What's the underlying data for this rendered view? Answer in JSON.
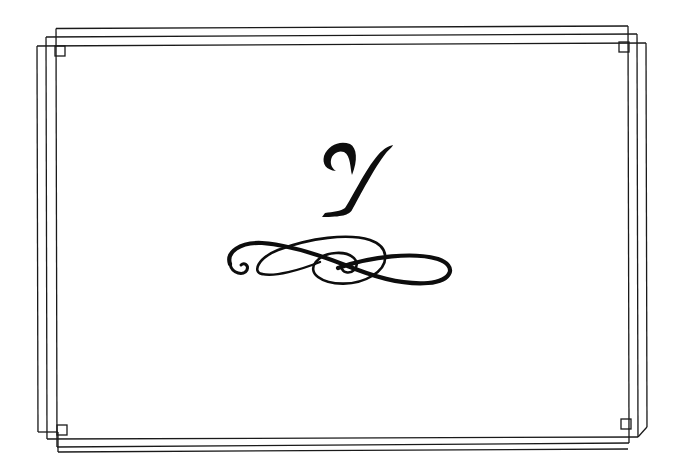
{
  "page": {
    "background": "#ffffff",
    "ink_color": "#1a1a1a"
  },
  "monogram": {
    "letter": "Y"
  },
  "ornament": {
    "icon": "flourish-scroll-icon"
  },
  "frame": {
    "style": "triple-offset-line-border",
    "corner_icon": "small-square-icon"
  }
}
